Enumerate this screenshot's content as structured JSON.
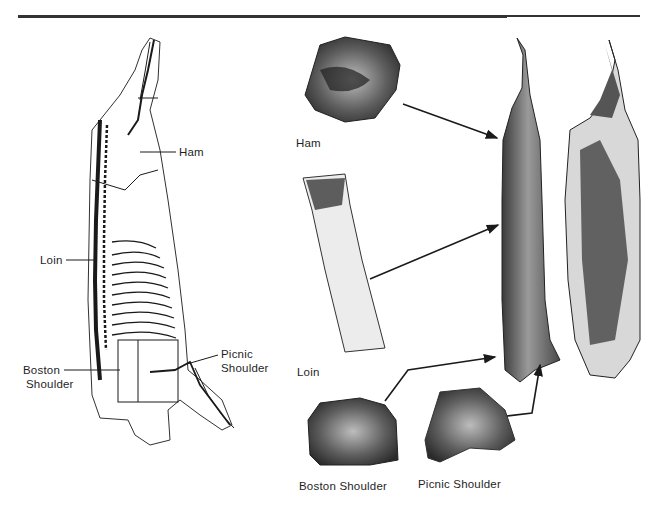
{
  "figure": {
    "diagram_labels": {
      "ham": "Ham",
      "loin": "Loin",
      "boston_shoulder_line1": "Boston",
      "boston_shoulder_line2": "Shoulder",
      "picnic_shoulder_line1": "Picnic",
      "picnic_shoulder_line2": "Shoulder"
    },
    "photo_labels": {
      "ham": "Ham",
      "loin": "Loin",
      "boston_shoulder": "Boston Shoulder",
      "picnic_shoulder": "Picnic Shoulder"
    },
    "colors": {
      "rule": "#333333",
      "ink": "#1a1a1a",
      "meat_dark": "#2b2b2b",
      "meat_mid": "#7a7a7a",
      "fat_light": "#e8e8e8"
    }
  }
}
